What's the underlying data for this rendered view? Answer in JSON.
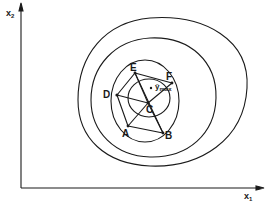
{
  "diagram": {
    "type": "simplex optimization on response-surface contours",
    "axes": {
      "x_label": "x",
      "x_sub": "1",
      "y_label": "x",
      "y_sub": "2"
    },
    "points": {
      "A": {
        "label": "A",
        "x": 128,
        "y": 126
      },
      "B": {
        "label": "B",
        "x": 163,
        "y": 133
      },
      "C": {
        "label": "C",
        "x": 148,
        "y": 103
      },
      "D": {
        "label": "D",
        "x": 117,
        "y": 95
      },
      "E": {
        "label": "E",
        "x": 135,
        "y": 73
      },
      "F": {
        "label": "F",
        "x": 172,
        "y": 83
      }
    },
    "optimum": {
      "marker": "•",
      "label": "ŷ",
      "sub": "max"
    },
    "contour_count": 4,
    "line_color": "#1a1a1a",
    "background": "#ffffff"
  }
}
